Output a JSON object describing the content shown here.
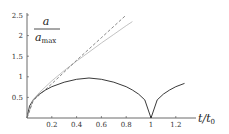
{
  "chart_data": {
    "type": "line",
    "title": "",
    "xlabel": "t/t0",
    "ylabel": "a/a_max",
    "ylabel_numerator": "a",
    "ylabel_denominator": "a",
    "ylabel_denominator_sub": "max",
    "xlabel_main": "t/t",
    "xlabel_sub": "0",
    "xlim": [
      0,
      1.38
    ],
    "ylim": [
      0,
      2.5
    ],
    "xticks": [
      "0.2",
      "0.4",
      "0.6",
      "0.8",
      "1",
      "1.2"
    ],
    "xtick_values": [
      0.2,
      0.4,
      0.6,
      0.8,
      1.0,
      1.2
    ],
    "yticks": [
      "0.5",
      "1",
      "1.5",
      "2",
      "2.5"
    ],
    "ytick_values": [
      0.5,
      1,
      1.5,
      2,
      2.5
    ],
    "grid": false,
    "legend": "none",
    "series": [
      {
        "name": "closed universe (cycloid)",
        "style": "solid",
        "color": "#222222",
        "x": [
          0,
          0.02,
          0.05,
          0.1,
          0.15,
          0.2,
          0.3,
          0.4,
          0.5,
          0.6,
          0.7,
          0.8,
          0.85,
          0.9,
          0.95,
          1.0,
          1.05,
          1.1,
          1.15,
          1.2,
          1.27
        ],
        "y": [
          0,
          0.29,
          0.44,
          0.58,
          0.68,
          0.76,
          0.87,
          0.94,
          0.97,
          0.94,
          0.87,
          0.76,
          0.68,
          0.58,
          0.44,
          0.0,
          0.44,
          0.58,
          0.68,
          0.76,
          0.84
        ]
      },
      {
        "name": "open universe",
        "style": "solid",
        "color": "#bbbbbb",
        "x": [
          0,
          0.05,
          0.1,
          0.2,
          0.3,
          0.4,
          0.5,
          0.6,
          0.7,
          0.8,
          0.85
        ],
        "y": [
          0,
          0.45,
          0.62,
          0.9,
          1.15,
          1.38,
          1.6,
          1.82,
          2.03,
          2.24,
          2.34
        ]
      },
      {
        "name": "linear",
        "style": "dashed",
        "color": "#555555",
        "x": [
          0,
          0.05,
          0.1,
          0.2,
          0.4,
          0.6,
          0.8
        ],
        "y": [
          0,
          0.42,
          0.56,
          0.83,
          1.4,
          1.95,
          2.5
        ]
      }
    ]
  }
}
